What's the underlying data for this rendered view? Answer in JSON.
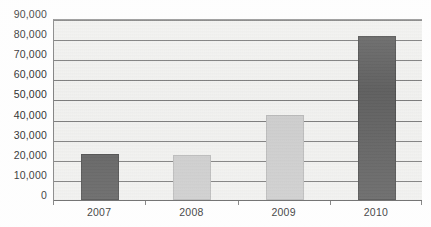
{
  "chart_data": {
    "type": "bar",
    "title": "",
    "subtitle": "",
    "xlabel": "",
    "ylabel": "",
    "categories": [
      "2007",
      "2008",
      "2009",
      "2010"
    ],
    "values": [
      23000,
      22500,
      42500,
      82000
    ],
    "series": [
      {
        "name": "",
        "values": [
          23000,
          22500,
          42500,
          82000
        ]
      }
    ],
    "ylim": [
      0,
      90000
    ],
    "y_ticks": [
      0,
      10000,
      20000,
      30000,
      40000,
      50000,
      60000,
      70000,
      80000,
      90000
    ],
    "y_tick_labels": [
      "0",
      "10,000",
      "20,000",
      "30,000",
      "40,000",
      "50,000",
      "60,000",
      "70,000",
      "80,000",
      "90,000"
    ],
    "x_tick_labels": [
      "2007",
      "2008",
      "2009",
      "2010"
    ],
    "grid": true,
    "grid_axis": "y",
    "legend": false,
    "legend_position": "none",
    "annotations": [],
    "bar_colors": [
      "#4d4d4d",
      "#c9c9c9",
      "#c9c9c9",
      "#4d4d4d"
    ],
    "colors": {
      "bar_dark": "#4d4d4d",
      "bar_light": "#c9c9c9",
      "plot_background": "#f2f2f0",
      "gridline": "#6e6e6e",
      "axis": "#555555",
      "text": "#141414"
    }
  }
}
